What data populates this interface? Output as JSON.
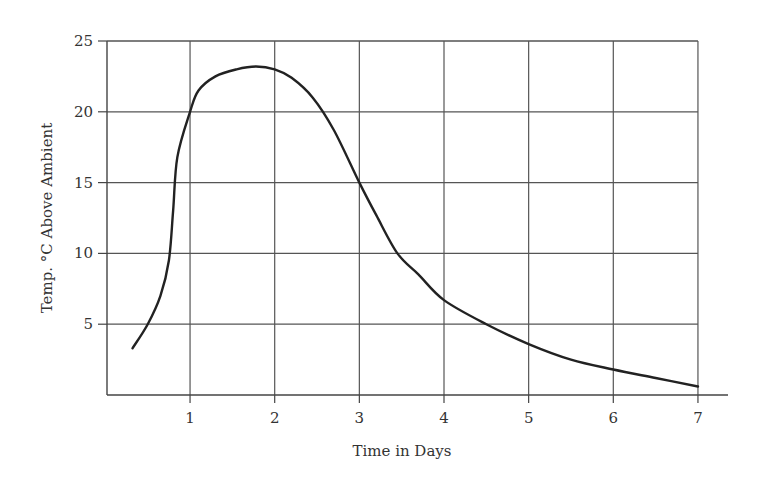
{
  "chart_data": {
    "type": "line",
    "title": "",
    "xlabel": "Time in Days",
    "ylabel": "Temp. °C Above Ambient",
    "xlim": [
      0,
      7
    ],
    "ylim": [
      0,
      25
    ],
    "grid": true,
    "legend": null,
    "x_ticks": [
      "1",
      "2",
      "3",
      "4",
      "5",
      "6",
      "7"
    ],
    "y_ticks": [
      "5",
      "10",
      "15",
      "20",
      "25"
    ],
    "series": [
      {
        "name": "Temperature above ambient",
        "color": "#222222",
        "x": [
          0.32,
          0.5,
          0.65,
          0.75,
          0.8,
          0.85,
          1.0,
          1.1,
          1.3,
          1.55,
          1.78,
          2.0,
          2.2,
          2.45,
          2.7,
          3.0,
          3.2,
          3.45,
          3.7,
          4.0,
          4.5,
          5.0,
          5.5,
          6.0,
          6.5,
          7.0
        ],
        "y": [
          3.3,
          5.0,
          7.0,
          9.5,
          13.0,
          16.8,
          20.0,
          21.5,
          22.5,
          23.0,
          23.2,
          23.0,
          22.4,
          21.0,
          18.7,
          15.0,
          12.7,
          10.0,
          8.5,
          6.7,
          5.0,
          3.6,
          2.5,
          1.8,
          1.2,
          0.6
        ]
      }
    ]
  }
}
